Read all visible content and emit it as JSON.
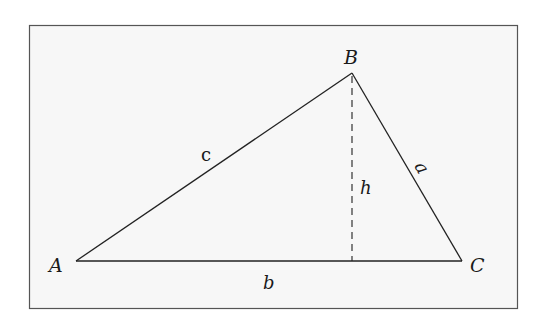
{
  "figure": {
    "type": "triangle-altitude",
    "frame": {
      "x": 29,
      "y": 25,
      "width": 489,
      "height": 284,
      "background": "#f7f7f7",
      "border": "#555555"
    },
    "vertices": {
      "A": {
        "label": "A",
        "x": 76,
        "y": 261
      },
      "B": {
        "label": "B",
        "x": 352,
        "y": 73
      },
      "C": {
        "label": "C",
        "x": 462,
        "y": 261
      }
    },
    "sides": {
      "a": {
        "label": "a",
        "from": "B",
        "to": "C"
      },
      "b": {
        "label": "b",
        "from": "A",
        "to": "C"
      },
      "c": {
        "label": "c",
        "from": "A",
        "to": "B"
      }
    },
    "altitude": {
      "label": "h",
      "from": "B",
      "foot_x": 352,
      "foot_y": 261,
      "style": "dashed"
    },
    "colors": {
      "stroke": "#222222",
      "text": "#1a1a1a"
    }
  }
}
